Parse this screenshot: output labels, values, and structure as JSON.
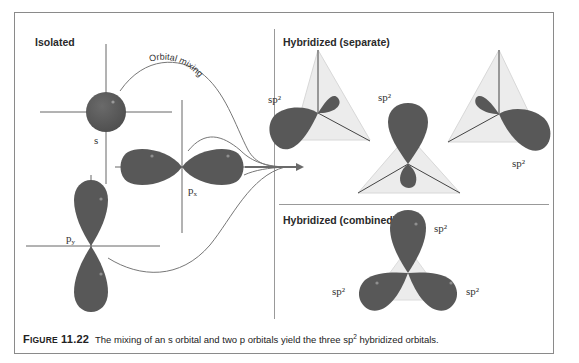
{
  "figure": {
    "sections": {
      "isolated": "Isolated",
      "hybridized_separate": "Hybridized (separate)",
      "hybridized_combined": "Hybridized (combined)"
    },
    "arrow_label": "Orbital mixing",
    "orbital_labels": {
      "s": "s",
      "px": "p",
      "px_sub": "x",
      "py": "p",
      "py_sub": "y",
      "sp2_separate": [
        "sp²",
        "sp²",
        "sp²"
      ],
      "sp2_combined": [
        "sp²",
        "sp²",
        "sp²"
      ]
    },
    "caption": {
      "figure_word_first": "F",
      "figure_word_rest": "IGURE",
      "figure_number": "11.22",
      "text_before_sup": "The mixing of an s orbital and two p orbitals yield the three sp",
      "sup": "2",
      "text_after_sup": " hybridized orbitals."
    },
    "colors": {
      "orbital_fill": "#5a5a5a",
      "tetra_fill": "#ececec",
      "axis": "#555555",
      "frame": "#8a8a8a"
    }
  }
}
